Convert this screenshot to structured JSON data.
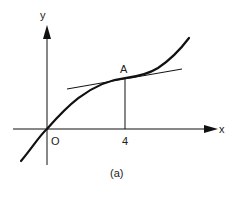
{
  "figure": {
    "caption": "(a)",
    "axes": {
      "x_label": "x",
      "y_label": "y",
      "origin_label": "O"
    },
    "point": {
      "label": "A",
      "x_tick_label": "4"
    },
    "elements": {
      "curve": "cubic-like increasing curve through origin with inflection at A",
      "tangent": "tangent line touching curve at point A",
      "drop_line": "vertical line from A to x-axis at x = 4"
    },
    "colors": {
      "ink": "#111111",
      "background": "#ffffff"
    }
  }
}
